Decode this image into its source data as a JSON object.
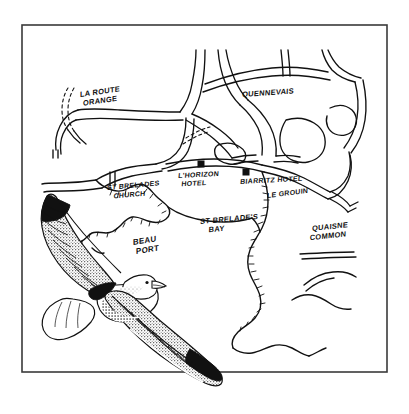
{
  "illustration": {
    "title": "St Brelade's Bay hand-drawn tourist map with flying seagull",
    "style": "pen-and-ink line drawing",
    "background_color": "#ffffff",
    "ink_color": "#111111",
    "frame": {
      "name": "map-border-frame",
      "x": 22,
      "y": 25,
      "width": 365,
      "height": 347,
      "stroke_color": "#3a3a3a"
    },
    "map_labels": [
      {
        "id": "la-route-orange",
        "text": "LA ROUTE\nORANGE",
        "lines": [
          "LA ROUTE",
          "ORANGE"
        ],
        "x": 80,
        "y": 97,
        "rotation": -8,
        "size": 7.5
      },
      {
        "id": "quennevais",
        "text": "QUENNEVAIS",
        "lines": [
          "QUENNEVAIS"
        ],
        "x": 242,
        "y": 97,
        "rotation": -4,
        "size": 7.5
      },
      {
        "id": "lhorizon-hotel",
        "text": "L'HORIZON\nHOTEL",
        "lines": [
          "L'HORIZON",
          "HOTEL"
        ],
        "x": 178,
        "y": 178,
        "rotation": -3,
        "size": 7
      },
      {
        "id": "biarritz-hotel",
        "text": "BIARRITZ HOTEL",
        "lines": [
          "BIARRITZ HOTEL"
        ],
        "x": 240,
        "y": 184,
        "rotation": -3,
        "size": 7
      },
      {
        "id": "le-grouin",
        "text": "LE GROUIN",
        "lines": [
          "LE GROUIN"
        ],
        "x": 267,
        "y": 198,
        "rotation": -7,
        "size": 7
      },
      {
        "id": "st-brelades-church",
        "text": "ST BRELADES\nCHURCH",
        "lines": [
          "ST BRELADES",
          "CHURCH"
        ],
        "x": 107,
        "y": 190,
        "rotation": -5,
        "size": 7
      },
      {
        "id": "st-brelades-bay",
        "text": "ST BRELADE'S\nBAY",
        "lines": [
          "ST BRELADE'S",
          "BAY"
        ],
        "x": 200,
        "y": 224,
        "rotation": -5,
        "size": 7.5
      },
      {
        "id": "beau-port",
        "text": "BEAU\nPORT",
        "lines": [
          "BEAU",
          "PORT"
        ],
        "x": 133,
        "y": 245,
        "rotation": -9,
        "size": 8
      },
      {
        "id": "quaisne-common",
        "text": "QUAISNE\nCOMMON",
        "lines": [
          "QUAISNE",
          "COMMON"
        ],
        "x": 312,
        "y": 231,
        "rotation": -6,
        "size": 7.5
      }
    ],
    "site_markers": [
      {
        "id": "marker-lhorizon-hotel",
        "label_ref": "lhorizon-hotel",
        "x": 201,
        "y": 164,
        "size": 7,
        "shape": "filled-square"
      },
      {
        "id": "marker-biarritz-hotel",
        "label_ref": "biarritz-hotel",
        "x": 246,
        "y": 172,
        "size": 7,
        "shape": "filled-square"
      }
    ],
    "features": [
      {
        "id": "road-network",
        "name": "roads",
        "description": "double-line drawn road network across upper map"
      },
      {
        "id": "coastline",
        "name": "coastline",
        "description": "hatched cliff coastline around St Brelade's Bay"
      },
      {
        "id": "seagull",
        "name": "flying-seagull",
        "description": "ink-drawn herring gull in flight, lower left, overlapping border"
      }
    ]
  }
}
